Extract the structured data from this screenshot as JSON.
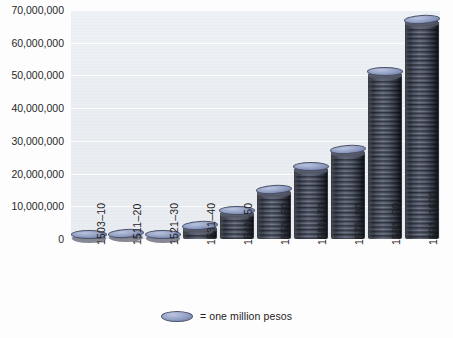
{
  "chart_data": {
    "type": "bar",
    "title": "",
    "subtitle": "",
    "xlabel": "",
    "ylabel": "",
    "ylim": [
      0,
      70000000
    ],
    "grid": true,
    "legend_position": "bottom",
    "legend": [
      {
        "icon": "coin-ellipse",
        "text": "= one million pesos"
      }
    ],
    "categories": [
      "1503–10",
      "1511–20",
      "1521–30",
      "1531–40",
      "1541–50",
      "1551–60",
      "1561–70",
      "1571–80",
      "1581–90",
      "1591–1600"
    ],
    "values": [
      2000000,
      2500000,
      1800000,
      5000000,
      9500000,
      16000000,
      23000000,
      28000000,
      52000000,
      68000000
    ],
    "y_ticks": [
      0,
      10000000,
      20000000,
      30000000,
      40000000,
      50000000,
      60000000,
      70000000
    ],
    "y_tick_labels": [
      "0",
      "10,000,000",
      "20,000,000",
      "30,000,000",
      "40,000,000",
      "50,000,000",
      "60,000,000",
      "70,000,000"
    ],
    "series": [
      {
        "name": "Treasure imports (pesos)",
        "values": [
          2000000,
          2500000,
          1800000,
          5000000,
          9500000,
          16000000,
          23000000,
          28000000,
          52000000,
          68000000
        ]
      }
    ],
    "colors": {
      "plot_background": "#eef2f6",
      "coin_top": "#96a3c6",
      "coin_edge": "#5d6271",
      "stack_body_dark": "#3f434e",
      "stack_body_light": "#b6bbc5",
      "text": "#1f2123",
      "gridline": "#ffffff"
    }
  }
}
